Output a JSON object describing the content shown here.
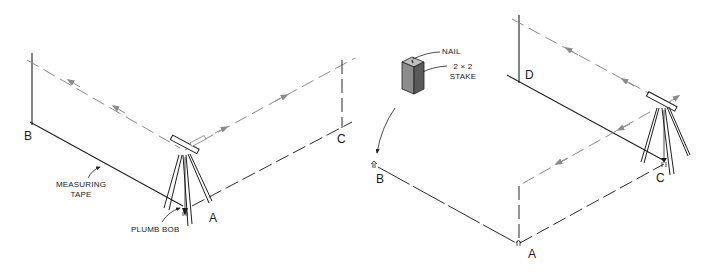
{
  "figure": {
    "left_panel": {
      "points": {
        "b": "B",
        "c": "C",
        "a": "A"
      },
      "callouts": {
        "measuring_tape_line1": "MEASURING",
        "measuring_tape_line2": "TAPE",
        "plumb_bob": "PLUMB BOB"
      }
    },
    "right_panel": {
      "points": {
        "b": "B",
        "d": "D",
        "c": "C",
        "a": "A"
      },
      "callouts": {
        "nail": "NAIL",
        "stake_line1": "2 × 2",
        "stake_line2": "STAKE"
      }
    },
    "colors": {
      "line": "#1e1e1e",
      "sight_line": "#8a8a8a",
      "stake_face": "#8c8c8c",
      "stake_side": "#5a5a5a",
      "background": "#ffffff"
    }
  }
}
